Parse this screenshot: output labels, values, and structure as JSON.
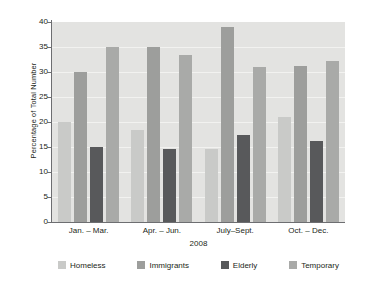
{
  "chart_data": {
    "type": "bar",
    "title": "",
    "subtitle": "",
    "xlabel": "2008",
    "ylabel": "Percentage of Total Number",
    "categories": [
      "Jan. – Mar.",
      "Apr. – Jun.",
      "July–Sept.",
      "Oct. – Dec."
    ],
    "series": [
      {
        "name": "Homeless",
        "color": "#c9cac8",
        "values": [
          20.0,
          18.4,
          14.7,
          21.0
        ]
      },
      {
        "name": "Immigrants",
        "color": "#9d9e9c",
        "values": [
          30.0,
          35.0,
          39.1,
          31.2
        ]
      },
      {
        "name": "Elderly",
        "color": "#58595b",
        "values": [
          15.0,
          14.7,
          17.4,
          16.3
        ]
      },
      {
        "name": "Temporary",
        "color": "#a9aaa8",
        "values": [
          35.0,
          33.5,
          31.1,
          32.3
        ]
      }
    ],
    "ylim": [
      0,
      40
    ],
    "ytick_step": 5,
    "yticks": [
      "40",
      "35",
      "30",
      "25",
      "20",
      "15",
      "10",
      "5",
      "0"
    ],
    "grid": true,
    "grid_color": "#f2f2f0",
    "plot_background": "#e3e3e1",
    "legend_position": "bottom"
  },
  "legend": {
    "items": [
      {
        "label": "Homeless"
      },
      {
        "label": "Immigrants"
      },
      {
        "label": "Elderly"
      },
      {
        "label": "Temporary"
      }
    ]
  }
}
